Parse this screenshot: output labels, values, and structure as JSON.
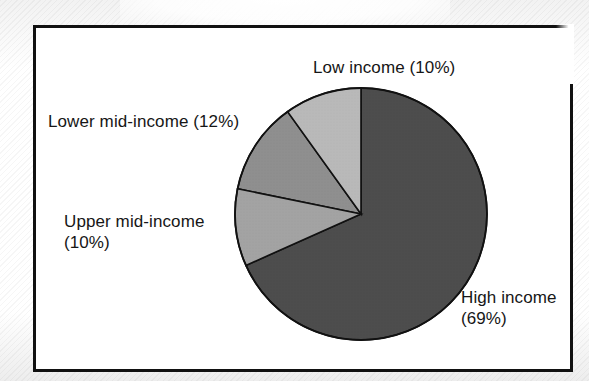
{
  "figure": {
    "frame_border_color": "#111111",
    "background_color": "#ffffff"
  },
  "chart_data": {
    "type": "pie",
    "title": "",
    "subtitle": "",
    "xlabel": "",
    "ylabel": "",
    "legend_position": "none",
    "labels_position": "outside-callout",
    "grid": false,
    "units": "percent",
    "start_angle_deg": 0,
    "direction": "counterclockwise",
    "categories": [
      "Low income",
      "Lower mid-income",
      "Upper mid-income",
      "High income"
    ],
    "values": [
      10,
      12,
      10,
      69
    ],
    "value_suffix": "%",
    "colors": [
      "#b9b9b9",
      "#8f8f8f",
      "#a3a3a3",
      "#4d4d4d"
    ],
    "slices": [
      {
        "name": "low-income",
        "label": "Low income (10%)",
        "category": "Low income",
        "value": 10,
        "display_value": "(10%)",
        "color": "#b9b9b9",
        "start_deg": 0,
        "end_deg": 36
      },
      {
        "name": "lower-mid-income",
        "label": "Lower mid-income (12%)",
        "category": "Lower mid-income",
        "value": 12,
        "display_value": "(12%)",
        "color": "#8f8f8f",
        "start_deg": 36,
        "end_deg": 79
      },
      {
        "name": "upper-mid-income",
        "label": "Upper mid-income (10%)",
        "category": "Upper mid-income",
        "value": 10,
        "display_value": "(10%)",
        "color": "#a3a3a3",
        "start_deg": 79,
        "end_deg": 115
      },
      {
        "name": "high-income",
        "label": "High income (69%)",
        "category": "High income",
        "value": 69,
        "display_value": "(69%)",
        "color": "#4d4d4d",
        "start_deg": 115,
        "end_deg": 360
      }
    ]
  },
  "labels": {
    "low_income": "Low income (10%)",
    "lower_mid_income": "Lower mid-income (12%)",
    "upper_mid_income_line1": "Upper mid-income",
    "upper_mid_income_line2": "(10%)",
    "high_income_line1": "High income",
    "high_income_line2": "(69%)"
  }
}
